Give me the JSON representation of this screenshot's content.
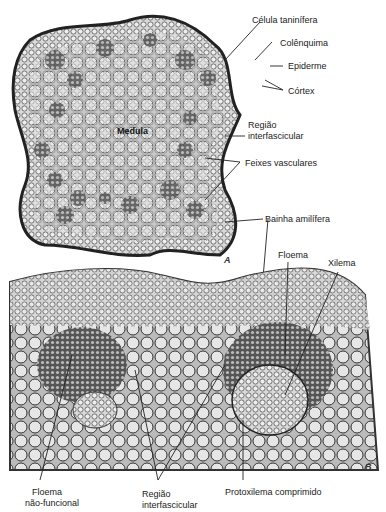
{
  "figure": {
    "panel_a": {
      "letter": "A",
      "center_label": "Medula",
      "labels": [
        {
          "id": "celula-taninifera",
          "text": "Célula taninífera"
        },
        {
          "id": "colenquima",
          "text": "Colênquima"
        },
        {
          "id": "epiderme",
          "text": "Epiderme"
        },
        {
          "id": "cortex",
          "text": "Córtex"
        },
        {
          "id": "regiao-interfascicular-1",
          "text": "Região"
        },
        {
          "id": "regiao-interfascicular-2",
          "text": "interfascicular"
        },
        {
          "id": "feixes-vasculares",
          "text": "Feixes vasculares"
        },
        {
          "id": "bainha-amilifera",
          "text": "Bainha amilífera"
        }
      ]
    },
    "panel_b": {
      "letter": "B",
      "labels": [
        {
          "id": "floema",
          "text": "Floema"
        },
        {
          "id": "xilema",
          "text": "Xilema"
        },
        {
          "id": "floema-nao-funcional-1",
          "text": "Floema"
        },
        {
          "id": "floema-nao-funcional-2",
          "text": "não-funcional"
        },
        {
          "id": "regiao-interfascicular-b-1",
          "text": "Região"
        },
        {
          "id": "regiao-interfascicular-b-2",
          "text": "interfascicular"
        },
        {
          "id": "protoxilema",
          "text": "Protoxilema comprimido"
        }
      ]
    }
  }
}
